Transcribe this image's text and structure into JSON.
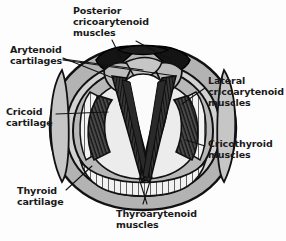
{
  "figure": {
    "colors": {
      "background": "#fdfdfd",
      "cartilage_gray": "#b0b0b0",
      "cartilage_light": "#c9c9c9",
      "muscle_dark": "#2b2b2b",
      "muscle_black": "#121212",
      "glottis_white": "#fbfbfb",
      "outline": "#111111",
      "text": "#1a1a1a"
    }
  },
  "labels": {
    "posterior_cricoarytenoid": "Posterior\ncricoarytenoid\nmuscles",
    "arytenoid_cartilages": "Arytenoid\ncartilages",
    "cricoid_cartilage": "Cricoid\ncartilage",
    "thyroid_cartilage": "Thyroid\ncartilage",
    "lateral_cricoarytenoid": "Lateral\ncricoarytenoid\nmuscles",
    "cricothyroid": "Cricothyroid\nmuscles",
    "thyroarytenoid": "Thyroarytenoid\nmuscles"
  }
}
